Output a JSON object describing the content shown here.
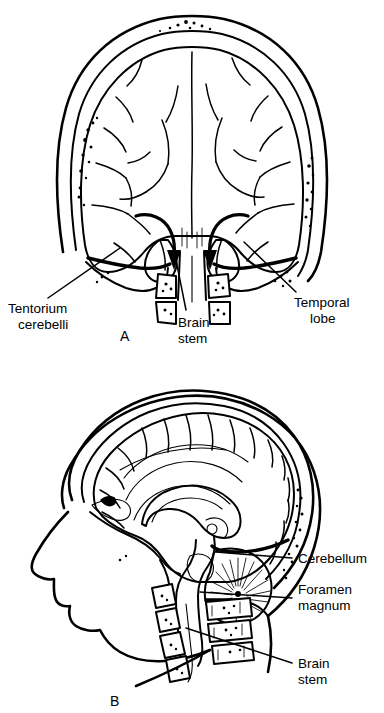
{
  "figure": {
    "background_color": "#ffffff",
    "ink_color": "#000000",
    "width": 384,
    "height": 713
  },
  "panels": [
    {
      "id": "A",
      "letter": "A",
      "view": "coronal section of skull and brain showing transtentorial (uncal) herniation",
      "labels": [
        {
          "key": "tentorium",
          "line1": "Tentorium",
          "line2": "cerebelli"
        },
        {
          "key": "brainstem",
          "line1": "Brain",
          "line2": "stem"
        },
        {
          "key": "temporal",
          "line1": "Temporal",
          "line2": "lobe"
        }
      ],
      "arrows": [
        {
          "key": "herniation-arrow-left",
          "direction": "downward"
        },
        {
          "key": "herniation-arrow-right",
          "direction": "downward"
        }
      ]
    },
    {
      "id": "B",
      "letter": "B",
      "view": "midsagittal section of head showing brain, cerebellum, brainstem and foramen magnum",
      "labels": [
        {
          "key": "cerebellum",
          "line1": "Cerebellum",
          "line2": ""
        },
        {
          "key": "foramen",
          "line1": "Foramen",
          "line2": "magnum"
        },
        {
          "key": "brainstem",
          "line1": "Brain",
          "line2": "stem"
        }
      ]
    }
  ],
  "text": {
    "panel_a_letter": "A",
    "panel_b_letter": "B",
    "a_tentorium_1": "Tentorium",
    "a_tentorium_2": "cerebelli",
    "a_brainstem_1": "Brain",
    "a_brainstem_2": "stem",
    "a_temporal_1": "Temporal",
    "a_temporal_2": "lobe",
    "b_cerebellum": "Cerebellum",
    "b_foramen_1": "Foramen",
    "b_foramen_2": "magnum",
    "b_brainstem_1": "Brain",
    "b_brainstem_2": "stem"
  }
}
